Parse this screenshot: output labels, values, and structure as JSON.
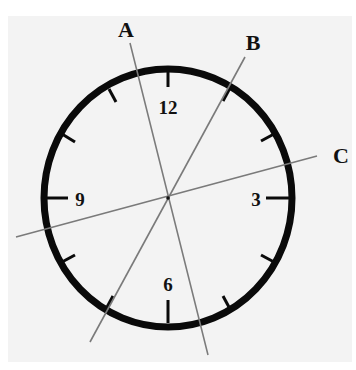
{
  "figure": {
    "background_color": "#f3f3f3",
    "clock": {
      "center": [
        168,
        198
      ],
      "radius_x": 124,
      "radius_y": 129,
      "rim_color": "#0a0a0a",
      "numerals": [
        {
          "text": "12",
          "x": 168,
          "y": 114
        },
        {
          "text": "3",
          "x": 256,
          "y": 206
        },
        {
          "text": "9",
          "x": 80,
          "y": 206
        },
        {
          "text": "6",
          "x": 168,
          "y": 291
        }
      ]
    },
    "lines": [
      {
        "label": "A",
        "x1": 130,
        "y1": 43,
        "x2": 208,
        "y2": 355,
        "label_x": 126,
        "label_y": 37
      },
      {
        "label": "B",
        "x1": 245,
        "y1": 57,
        "x2": 90,
        "y2": 342,
        "label_x": 253,
        "label_y": 50
      },
      {
        "label": "C",
        "x1": 317,
        "y1": 156,
        "x2": 16,
        "y2": 237,
        "label_x": 341,
        "label_y": 163
      }
    ],
    "line_color": "#7a7a7a"
  }
}
